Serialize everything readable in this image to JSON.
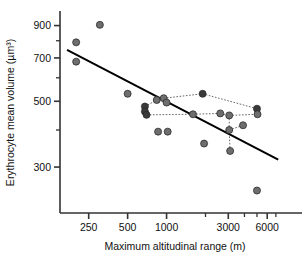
{
  "chart_data": {
    "type": "scatter",
    "title": "",
    "xlabel": "Maximum altitudinal range (m)",
    "ylabel": "Erythrocyte mean volume (µm³)",
    "xscale": "log",
    "yscale": "log",
    "xlim": [
      150,
      9000
    ],
    "ylim": [
      210,
      1000
    ],
    "grid": false,
    "legend": null,
    "xticks": [
      {
        "value": 250,
        "label": "250",
        "major": true
      },
      {
        "value": 500,
        "label": "500",
        "major": true
      },
      {
        "value": 1000,
        "label": "1000",
        "major": true
      },
      {
        "value": 2000,
        "label": "",
        "major": false
      },
      {
        "value": 3000,
        "label": "3000",
        "major": true
      },
      {
        "value": 4000,
        "label": "",
        "major": false
      },
      {
        "value": 5000,
        "label": "",
        "major": false
      },
      {
        "value": 6000,
        "label": "6000",
        "major": true
      },
      {
        "value": 7000,
        "label": "",
        "major": false
      }
    ],
    "yticks": [
      {
        "value": 900,
        "label": "900",
        "major": true
      },
      {
        "value": 800,
        "label": "",
        "major": false
      },
      {
        "value": 700,
        "label": "700",
        "major": true
      },
      {
        "value": 600,
        "label": "",
        "major": false
      },
      {
        "value": 500,
        "label": "500",
        "major": true
      },
      {
        "value": 400,
        "label": "",
        "major": false
      },
      {
        "value": 300,
        "label": "300",
        "major": true
      }
    ],
    "marker": {
      "shape": "circle",
      "size_px": 7,
      "fill_light": "#6e6e6e",
      "fill_dark": "#3a3a3a",
      "edge": "#2b2b2b"
    },
    "points": [
      {
        "x": 200,
        "y": 790,
        "shade": "light"
      },
      {
        "x": 200,
        "y": 680,
        "shade": "light"
      },
      {
        "x": 305,
        "y": 905,
        "shade": "light"
      },
      {
        "x": 500,
        "y": 530,
        "shade": "light"
      },
      {
        "x": 680,
        "y": 480,
        "shade": "dark"
      },
      {
        "x": 680,
        "y": 462,
        "shade": "dark"
      },
      {
        "x": 700,
        "y": 450,
        "shade": "dark"
      },
      {
        "x": 840,
        "y": 505,
        "shade": "light"
      },
      {
        "x": 860,
        "y": 395,
        "shade": "light"
      },
      {
        "x": 950,
        "y": 512,
        "shade": "light"
      },
      {
        "x": 1000,
        "y": 495,
        "shade": "light"
      },
      {
        "x": 1020,
        "y": 395,
        "shade": "light"
      },
      {
        "x": 1600,
        "y": 452,
        "shade": "light"
      },
      {
        "x": 1900,
        "y": 530,
        "shade": "dark"
      },
      {
        "x": 1950,
        "y": 360,
        "shade": "light"
      },
      {
        "x": 2600,
        "y": 455,
        "shade": "light"
      },
      {
        "x": 3050,
        "y": 448,
        "shade": "light"
      },
      {
        "x": 3050,
        "y": 400,
        "shade": "light"
      },
      {
        "x": 3100,
        "y": 340,
        "shade": "light"
      },
      {
        "x": 3900,
        "y": 415,
        "shade": "light"
      },
      {
        "x": 5000,
        "y": 472,
        "shade": "dark"
      },
      {
        "x": 5050,
        "y": 452,
        "shade": "light"
      },
      {
        "x": 5000,
        "y": 250,
        "shade": "light"
      }
    ],
    "connections": [
      [
        [
          680,
          480
        ],
        [
          840,
          505
        ]
      ],
      [
        [
          840,
          505
        ],
        [
          950,
          512
        ]
      ],
      [
        [
          950,
          512
        ],
        [
          1000,
          495
        ]
      ],
      [
        [
          950,
          512
        ],
        [
          1900,
          530
        ]
      ],
      [
        [
          1900,
          530
        ],
        [
          5000,
          472
        ]
      ],
      [
        [
          700,
          450
        ],
        [
          1600,
          452
        ]
      ],
      [
        [
          1600,
          452
        ],
        [
          2600,
          455
        ]
      ],
      [
        [
          2600,
          455
        ],
        [
          3050,
          448
        ]
      ],
      [
        [
          3050,
          448
        ],
        [
          5050,
          452
        ]
      ],
      [
        [
          3050,
          448
        ],
        [
          3050,
          400
        ]
      ],
      [
        [
          3050,
          400
        ],
        [
          3900,
          415
        ]
      ],
      [
        [
          3050,
          400
        ],
        [
          3100,
          340
        ]
      ],
      [
        [
          5000,
          472
        ],
        [
          5050,
          452
        ]
      ]
    ],
    "regression_line": {
      "style": "solid",
      "color": "#000000",
      "width_px": 2,
      "endpoints": [
        [
          170,
          745
        ],
        [
          7300,
          318
        ]
      ]
    }
  }
}
